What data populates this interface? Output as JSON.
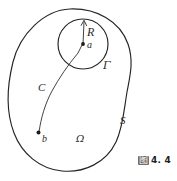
{
  "figure": {
    "type": "mathematical-diagram",
    "caption": {
      "prefix": "图",
      "number": "4. 4"
    },
    "labels": {
      "outer_boundary": "S",
      "region": "Ω",
      "inner_boundary": "Γ",
      "center_point": "a",
      "radius": "R",
      "curve": "C",
      "end_point": "b"
    },
    "geometry": {
      "center_a": {
        "x": 83,
        "y": 44
      },
      "point_b": {
        "x": 38,
        "y": 133
      },
      "circle_radius_px": 25,
      "radius_arrow_from": {
        "x": 83,
        "y": 44
      },
      "radius_arrow_to": {
        "x": 84,
        "y": 20
      }
    },
    "colors": {
      "stroke": "#242424",
      "label": "#2b2b2b",
      "background": "#ffffff",
      "caption_badge": "#6e6e6e"
    }
  }
}
